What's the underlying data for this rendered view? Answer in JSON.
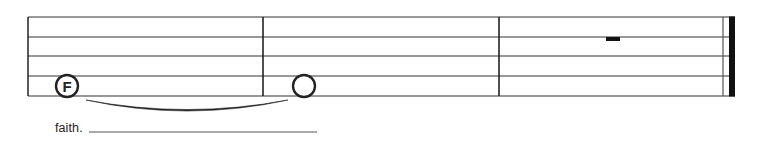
{
  "score": {
    "colors": {
      "ink": "#222222",
      "staff_line": "#333333",
      "extender": "#555555",
      "background": "#ffffff"
    },
    "staff": {
      "left_x": 28,
      "right_x": 735,
      "line_y": [
        17,
        37,
        56,
        76,
        96
      ]
    },
    "measures": [
      {
        "index": 1,
        "x_start": 28,
        "x_end": 263,
        "contents": [
          {
            "type": "note",
            "duration": "whole",
            "pitch_label": "F",
            "labeled": true,
            "cx": 67,
            "cy": 86
          }
        ]
      },
      {
        "index": 2,
        "x_start": 263,
        "x_end": 499,
        "contents": [
          {
            "type": "note",
            "duration": "whole",
            "pitch_label": "",
            "labeled": false,
            "cx": 304,
            "cy": 86,
            "tied_from_previous": true
          }
        ]
      },
      {
        "index": 3,
        "x_start": 499,
        "x_end": 735,
        "contents": [
          {
            "type": "rest",
            "duration": "whole",
            "x": 606,
            "y": 37,
            "w": 14,
            "h": 4
          }
        ]
      }
    ],
    "barlines": [
      {
        "type": "single",
        "x": 263
      },
      {
        "type": "single",
        "x": 499
      },
      {
        "type": "final",
        "thin_x": 723,
        "thick_x": 729,
        "thick_w": 6
      }
    ],
    "tie": {
      "from_x": 86,
      "to_x": 288,
      "y": 100,
      "depth": 11
    },
    "lyrics": {
      "text": "faith.",
      "extender_x1": 89,
      "extender_x2": 317,
      "extender_y": 132
    }
  }
}
